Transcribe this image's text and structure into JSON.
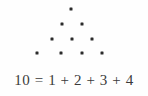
{
  "figure": {
    "type": "triangular-number-dot-diagram",
    "background_color": "#fefefe",
    "dot_color": "#2b2b2b",
    "text_color": "#3a3a3a",
    "caption": "10 = 1 + 2 + 3 + 4",
    "rows": [
      {
        "count": 1,
        "y": 9,
        "dots_x": [
          71
        ]
      },
      {
        "count": 2,
        "y": 24,
        "dots_x": [
          62,
          82
        ]
      },
      {
        "count": 3,
        "y": 39,
        "dots_x": [
          52,
          72,
          92
        ]
      },
      {
        "count": 4,
        "y": 53,
        "dots_x": [
          37,
          61,
          82,
          102
        ]
      }
    ]
  },
  "chart_data": {
    "type": "scatter",
    "title": "",
    "xlabel": "",
    "ylabel": "",
    "categories": [
      "row 1",
      "row 2",
      "row 3",
      "row 4"
    ],
    "values": [
      1,
      2,
      3,
      4
    ],
    "total": 10,
    "annotations": [
      "10 = 1 + 2 + 3 + 4"
    ]
  }
}
